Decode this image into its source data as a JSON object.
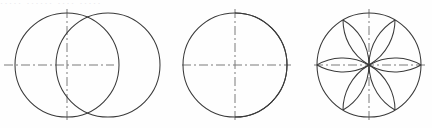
{
  "page": {
    "width": 432,
    "height": 128,
    "background_color": "#fefefe",
    "stroke_color": "#3a3a3a",
    "centerline_color": "#7a7a7a",
    "bleed_text": "·····  ······  ····  ·····"
  },
  "figures": [
    {
      "id": "figure-1",
      "name": "two-overlapping-circles",
      "caption": "",
      "circles": [
        {
          "cx": 67,
          "cy": 65,
          "r": 52
        },
        {
          "cx": 108,
          "cy": 65,
          "r": 52
        }
      ],
      "centerlines": {
        "horizontal": {
          "x1": 4,
          "y1": 65,
          "x2": 114,
          "y2": 65
        },
        "vertical": {
          "x1": 67,
          "y1": 9,
          "x2": 67,
          "y2": 122
        }
      }
    },
    {
      "id": "figure-2",
      "name": "circle-with-vesica-arc",
      "caption": "",
      "circles": [
        {
          "cx": 235,
          "cy": 65,
          "r": 52
        }
      ],
      "inner_arc": {
        "start": {
          "x": 235,
          "y": 13
        },
        "end": {
          "x": 235,
          "y": 117
        },
        "radius": 52,
        "sweep": 1,
        "large_arc": 0
      },
      "centerlines": {
        "horizontal": {
          "x1": 182,
          "y1": 65,
          "x2": 291,
          "y2": 65
        },
        "vertical": {
          "x1": 235,
          "y1": 9,
          "x2": 235,
          "y2": 122
        }
      }
    },
    {
      "id": "figure-3",
      "name": "six-petal-rosette",
      "caption": "",
      "circles": [
        {
          "cx": 369,
          "cy": 65,
          "r": 52
        }
      ],
      "petal_count": 6,
      "petal_angles_deg": [
        0,
        60,
        120,
        180,
        240,
        300
      ],
      "arc_radius": 52,
      "centerlines": {
        "horizontal": {
          "x1": 314,
          "y1": 65,
          "x2": 426,
          "y2": 65
        },
        "vertical": {
          "x1": 369,
          "y1": 9,
          "x2": 369,
          "y2": 122
        }
      }
    }
  ]
}
